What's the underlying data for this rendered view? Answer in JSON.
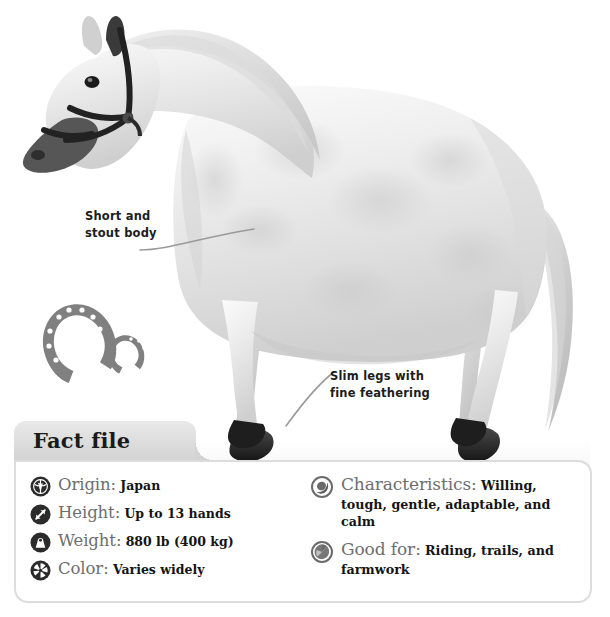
{
  "figure": {
    "photo_description": "Grayscale side-view photograph of a small white-grey pony wearing a dark halter, standing facing left",
    "background_color": "#ffffff"
  },
  "annotations": [
    {
      "id": "short-stout-body",
      "text": "Short and\nstout body",
      "leader": "curved line pointing right to the pony's barrel"
    },
    {
      "id": "slim-legs",
      "text": "Slim legs with\nfine feathering",
      "leader": "curved line pointing down-left to the pony's foreleg"
    }
  ],
  "decorations": {
    "horseshoes_icon": "horseshoe-pair-icon",
    "horseshoe_color": "#808080",
    "horseshoe_count": 2
  },
  "factfile": {
    "tab_title": "Fact file",
    "tab_color": "#dcdcdc",
    "panel_border_color": "#dcdcdc",
    "label_color": "#6e6e6e",
    "value_color": "#141414",
    "left_column": [
      {
        "icon": "globe-icon",
        "icon_style": "dark",
        "label": "Origin:",
        "value": "Japan"
      },
      {
        "icon": "height-arrows-icon",
        "icon_style": "dark",
        "label": "Height:",
        "value": "Up to 13 hands"
      },
      {
        "icon": "weight-icon",
        "icon_style": "dark",
        "label": "Weight:",
        "value": "880 lb (400 kg)"
      },
      {
        "icon": "color-wheel-icon",
        "icon_style": "dark",
        "label": "Color:",
        "value": "Varies widely"
      }
    ],
    "right_column": [
      {
        "icon": "characteristics-icon",
        "icon_style": "gray",
        "label": "Characteristics:",
        "value": "Willing, tough, gentle, adaptable, and calm"
      },
      {
        "icon": "good-for-icon",
        "icon_style": "gray",
        "label": "Good for:",
        "value": "Riding, trails, and farmwork"
      }
    ]
  }
}
